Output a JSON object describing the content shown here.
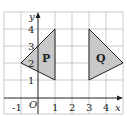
{
  "diagram": {
    "type": "coordinate-grid",
    "x_axis": {
      "label": "x",
      "ticks": [
        "-1",
        "1",
        "2",
        "3",
        "4"
      ],
      "range": [
        -2,
        5
      ]
    },
    "y_axis": {
      "label": "y",
      "ticks": [
        "1",
        "2",
        "3",
        "4"
      ],
      "range": [
        0,
        5
      ]
    },
    "origin_label": "O",
    "shapes": [
      {
        "label": "P",
        "vertices": [
          [
            1,
            4
          ],
          [
            1,
            1
          ],
          [
            -1,
            2
          ]
        ],
        "fill": "#c8c8c8"
      },
      {
        "label": "Q",
        "vertices": [
          [
            3,
            4
          ],
          [
            3,
            1
          ],
          [
            5,
            2
          ]
        ],
        "fill": "#c8c8c8"
      }
    ]
  }
}
